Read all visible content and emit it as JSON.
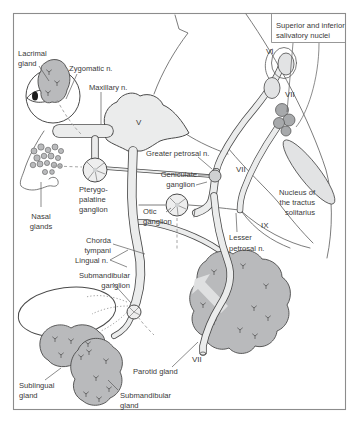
{
  "figure": {
    "type": "anatomical-diagram",
    "title_box": {
      "lines": [
        "Superior and inferior",
        "salivatory nuclei"
      ]
    },
    "labels": {
      "lacrimal_gland": [
        "Lacrimal",
        "gland"
      ],
      "zygomatic_n": [
        "Zygomatic n."
      ],
      "maxillary_n": [
        "Maxillary n."
      ],
      "greater_petrosal_n": [
        "Greater petrosal n."
      ],
      "geniculate_ganglion": [
        "Geniculate",
        "ganglion"
      ],
      "pterygopalatine_ganglion": [
        "Pterygo-",
        "palatine",
        "ganglion"
      ],
      "nasal_glands": [
        "Nasal",
        "glands"
      ],
      "otic_ganglion": [
        "Otic",
        "ganglion"
      ],
      "nucleus_tractus_solitarius": [
        "Nucleus of",
        "the tractus",
        "solitarius"
      ],
      "lesser_petrosal_n": [
        "Lesser",
        "petrosal n."
      ],
      "chorda_tympani": [
        "Chorda",
        "tympani"
      ],
      "lingual_n": [
        "Lingual n."
      ],
      "submandibular_ganglion": [
        "Submandibular",
        "ganglion"
      ],
      "sublingual_gland": [
        "Sublingual",
        "gland"
      ],
      "submandibular_gland": [
        "Submandibular",
        "gland"
      ],
      "parotid_gland": [
        "Parotid gland"
      ]
    },
    "numerals": {
      "trigeminal": "V",
      "abducens": "VI",
      "facial": "VII",
      "glossopharyngeal": "IX"
    },
    "colors": {
      "background": "#ffffff",
      "border": "#8c8c8c",
      "outline": "#4a4a4a",
      "line": "#5a5a5a",
      "nerve_fill": "#ebecec",
      "gland_fill": "#b9babc",
      "nucleus_fill": "#e2e3e4",
      "dark_nucleus_fill": "#a7a9ab",
      "ganglion_fill": "#eeeeee",
      "text": "#3a3a3a",
      "dash": "#9b9b9b",
      "arrow_fill": "#dfe0e1",
      "pupil": "#1c1c1c",
      "geniculate_fill": "#cfd1d2"
    }
  }
}
